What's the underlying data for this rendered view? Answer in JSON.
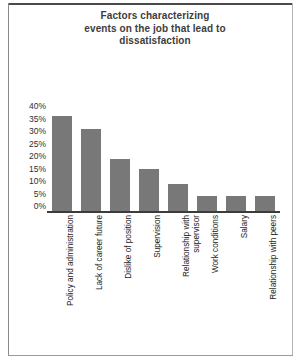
{
  "title": {
    "line1": "Factors characterizing",
    "line2": "events on the job that lead to",
    "line3": "dissatisfaction"
  },
  "colors": {
    "bar": "#787878",
    "axis": "#3c3c3c",
    "title_text": "#3d3d3d",
    "label_text": "#222222",
    "background": "#ffffff"
  },
  "chart_data": {
    "type": "bar",
    "title": "Factors characterizing events on the job that lead to dissatisfaction",
    "xlabel": "",
    "ylabel": "",
    "ylim": [
      0,
      40
    ],
    "ytick_labels": [
      "40%",
      "35%",
      "30%",
      "25%",
      "20%",
      "15%",
      "10%",
      "5%",
      "0%"
    ],
    "ytick_values": [
      40,
      35,
      30,
      25,
      20,
      15,
      10,
      5,
      0
    ],
    "grid": false,
    "legend": "none",
    "categories": [
      "Policy and administration",
      "Lack of career future",
      "Dislike of position",
      "Supervision",
      "Relationship with supervisor",
      "Work conditions",
      "Salary",
      "Relationship with peers"
    ],
    "values": [
      38,
      33,
      21,
      17,
      11,
      6,
      6,
      6
    ],
    "value_labels": [
      "38%",
      "33%",
      "21%",
      "17%",
      "11%",
      "6%",
      "6%",
      "6%"
    ]
  },
  "category_lines": [
    [
      "Policy and administration"
    ],
    [
      "Lack of career future"
    ],
    [
      "Dislike of position"
    ],
    [
      "Supervision"
    ],
    [
      "Relationship with",
      "supervisor"
    ],
    [
      "Work conditions"
    ],
    [
      "Salary"
    ],
    [
      "Relationship with peers"
    ]
  ]
}
